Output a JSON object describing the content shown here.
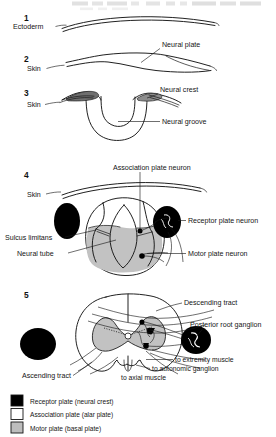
{
  "figure": {
    "title_faded": "",
    "stages": [
      {
        "number": "1",
        "labels": [
          {
            "name": "ectoderm",
            "text": "Ectoderm"
          }
        ]
      },
      {
        "number": "2",
        "labels": [
          {
            "name": "skin",
            "text": "Skin"
          },
          {
            "name": "neural-plate",
            "text": "Neural plate"
          }
        ]
      },
      {
        "number": "3",
        "labels": [
          {
            "name": "skin",
            "text": "Skin"
          },
          {
            "name": "neural-crest",
            "text": "Neural crest"
          },
          {
            "name": "neural-groove",
            "text": "Neural groove"
          }
        ]
      },
      {
        "number": "4",
        "labels": [
          {
            "name": "skin",
            "text": "Skin"
          },
          {
            "name": "association-plate-neuron",
            "text": "Association plate neuron"
          },
          {
            "name": "receptor-plate-neuron",
            "text": "Receptor plate neuron"
          },
          {
            "name": "sulcus-limitans",
            "text": "Sulcus limitans"
          },
          {
            "name": "neural-tube",
            "text": "Neural tube"
          },
          {
            "name": "motor-plate-neuron",
            "text": "Motor plate neuron"
          }
        ]
      },
      {
        "number": "5",
        "labels": [
          {
            "name": "descending-tract",
            "text": "Descending tract"
          },
          {
            "name": "posterior-root-ganglion",
            "text": "Posterior root ganglion"
          },
          {
            "name": "ascending-tract",
            "text": "Ascending tract"
          },
          {
            "name": "to-extremity-muscle",
            "text": "to extremity muscle"
          },
          {
            "name": "to-autonomic-ganglion",
            "text": "to autonomic ganglion"
          },
          {
            "name": "to-axial-muscle",
            "text": "to axial muscle"
          }
        ]
      }
    ]
  },
  "legend": {
    "items": [
      {
        "name": "receptor-plate",
        "text": "Receptor  plate (neural crest)",
        "swatch": "#000000"
      },
      {
        "name": "association-plate",
        "text": "Association plate (alar plate)",
        "swatch": "#ffffff"
      },
      {
        "name": "motor-plate",
        "text": "Motor plate (basal plate)",
        "swatch": "#bdbdbd"
      }
    ]
  },
  "colors": {
    "ink": "#151515",
    "paper": "#ffffff",
    "gray_fill": "#bdbdbd",
    "dark_fill": "#000000",
    "crest_gray": "#8a8a8a"
  }
}
